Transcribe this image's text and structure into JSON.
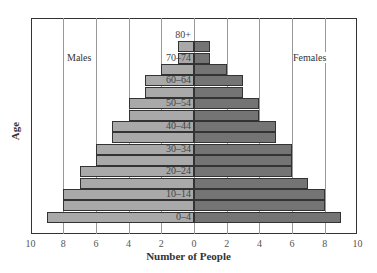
{
  "chart_data": {
    "type": "bar",
    "subtype": "population-pyramid",
    "title": "",
    "xlabel": "Number of People",
    "ylabel": "Age",
    "xlim": [
      -10,
      10
    ],
    "x_ticks": [
      "10",
      "8",
      "6",
      "4",
      "2",
      "0",
      "2",
      "4",
      "6",
      "8",
      "10"
    ],
    "grid": true,
    "categories": [
      "0–4",
      "5–9",
      "10–14",
      "15–19",
      "20–24",
      "25–29",
      "30–34",
      "35–39",
      "40–44",
      "45–49",
      "50–54",
      "55–59",
      "60–64",
      "65–69",
      "70–74",
      "75–79",
      "80+"
    ],
    "age_labels_shown": [
      "0–4",
      "10–14",
      "20–24",
      "30–34",
      "40–44",
      "50–54",
      "60–64",
      "70–74",
      "80+"
    ],
    "series": [
      {
        "name": "Males",
        "color": "#a9a9a9",
        "values": [
          9,
          8,
          8,
          7,
          7,
          6,
          6,
          5,
          5,
          4,
          4,
          3,
          3,
          2,
          1,
          1,
          0
        ]
      },
      {
        "name": "Females",
        "color": "#747474",
        "values": [
          9,
          8,
          8,
          7,
          6,
          6,
          6,
          5,
          5,
          4,
          4,
          3,
          3,
          2,
          1,
          1,
          0
        ]
      }
    ],
    "legend": {
      "left": "Males",
      "right": "Females",
      "position": "inside-top"
    }
  }
}
